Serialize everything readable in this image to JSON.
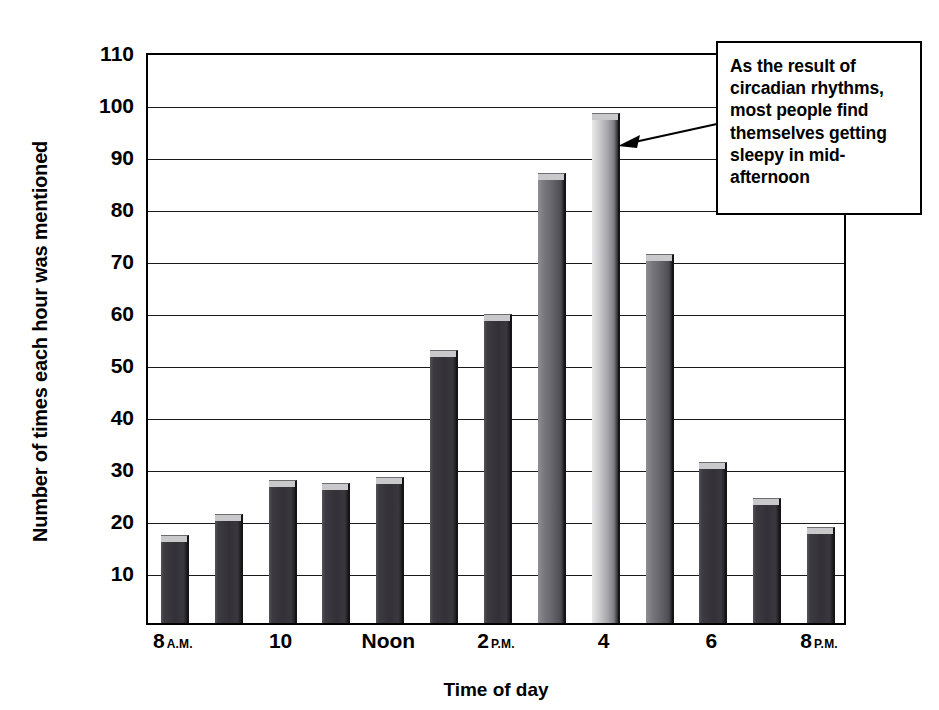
{
  "chart_data": {
    "type": "bar",
    "title": "",
    "xlabel": "Time of day",
    "ylabel": "Number of times each hour was mentioned",
    "ylim": [
      0,
      110
    ],
    "ytick_start": 10,
    "ytick_step": 10,
    "grid": true,
    "legend": "none",
    "categories": [
      "8 A.M.",
      "9",
      "10",
      "11",
      "Noon",
      "1 P.M.",
      "2 P.M.",
      "3 P.M.",
      "4 P.M.",
      "5 P.M.",
      "6 P.M.",
      "7 P.M.",
      "8 P.M."
    ],
    "values": [
      17,
      21,
      27.5,
      27,
      28,
      52.5,
      59.5,
      86.5,
      98,
      71,
      31,
      24,
      18.5
    ],
    "bar_shades": [
      "dark",
      "dark",
      "dark",
      "dark",
      "dark",
      "dark",
      "dark",
      "mid",
      "light",
      "mid",
      "dark",
      "dark",
      "dark"
    ],
    "ytick_labels": [
      "110",
      "100",
      "90",
      "80",
      "70",
      "60",
      "50",
      "40",
      "30",
      "20",
      "10"
    ],
    "xtick_labels": [
      {
        "index": 0,
        "main": "8",
        "suffix": "A.M."
      },
      {
        "index": 2,
        "main": "10",
        "suffix": ""
      },
      {
        "index": 4,
        "main": "Noon",
        "suffix": ""
      },
      {
        "index": 6,
        "main": "2",
        "suffix": "P.M."
      },
      {
        "index": 8,
        "main": "4",
        "suffix": ""
      },
      {
        "index": 10,
        "main": "6",
        "suffix": ""
      },
      {
        "index": 12,
        "main": "8",
        "suffix": "P.M."
      }
    ],
    "annotations": [
      {
        "text": "As the result of circadian rhythms, most people find themselves getting sleepy in mid-afternoon",
        "points_to_category": "4 P.M.",
        "points_to_value": 98
      }
    ],
    "colors": {
      "bar_dark": "#333137",
      "bar_mid": "#616066",
      "bar_light": "#a9a8ad",
      "bar_cap": "#c9c9cb",
      "axis": "#000000",
      "grid": "#1a1a1a",
      "background": "#ffffff"
    }
  },
  "axis_titles": {
    "y": "Number of times each hour was mentioned",
    "x": "Time of day"
  },
  "callout": {
    "text": "As the result of circadian rhythms, most people find themselves getting sleepy in mid-afternoon"
  }
}
